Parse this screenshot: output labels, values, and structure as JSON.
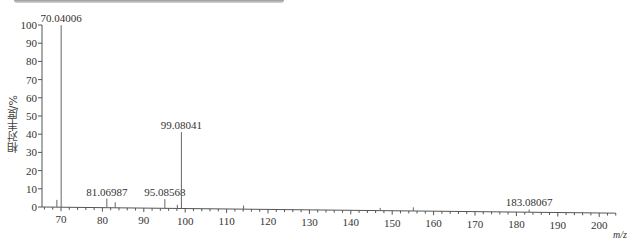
{
  "header_bar": {
    "text": ""
  },
  "chart_data": {
    "type": "bar",
    "subtype": "mass-spectrum-stick",
    "title": "",
    "xlabel": "m/z",
    "ylabel": "相对丰度/%",
    "xlim": [
      66,
      204
    ],
    "ylim": [
      0,
      100
    ],
    "x_ticks": [
      70,
      80,
      90,
      100,
      110,
      120,
      130,
      140,
      150,
      160,
      170,
      180,
      190,
      200
    ],
    "y_ticks": [
      0,
      10,
      20,
      30,
      40,
      50,
      60,
      70,
      80,
      90,
      100
    ],
    "grid": false,
    "legend": null,
    "peaks": [
      {
        "mz": 69.0,
        "intensity": 4,
        "label": ""
      },
      {
        "mz": 70.04006,
        "intensity": 100,
        "label": "70.04006"
      },
      {
        "mz": 81.06987,
        "intensity": 5,
        "label": "81.06987"
      },
      {
        "mz": 83.1,
        "intensity": 3,
        "label": ""
      },
      {
        "mz": 95.08568,
        "intensity": 5,
        "label": "95.08568"
      },
      {
        "mz": 98.1,
        "intensity": 2,
        "label": ""
      },
      {
        "mz": 99.08041,
        "intensity": 42,
        "label": "99.08041"
      },
      {
        "mz": 114.1,
        "intensity": 2,
        "label": ""
      },
      {
        "mz": 147.1,
        "intensity": 1.5,
        "label": ""
      },
      {
        "mz": 155.1,
        "intensity": 2,
        "label": ""
      },
      {
        "mz": 183.08067,
        "intensity": 1.5,
        "label": "183.08067"
      }
    ]
  }
}
